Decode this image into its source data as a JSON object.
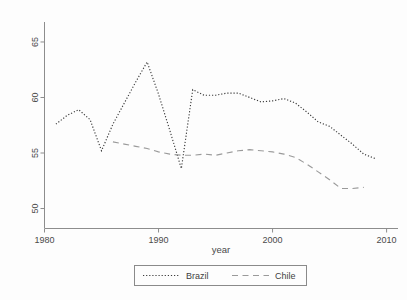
{
  "chart_data": {
    "type": "line",
    "title": "",
    "xlabel": "year",
    "ylabel": "",
    "xlim": [
      1980,
      2011
    ],
    "ylim": [
      48.2,
      66.8
    ],
    "grid": false,
    "legend_position": "bottom",
    "x_ticks": [
      "1980",
      "1990",
      "2000",
      "2010"
    ],
    "x_tick_values": [
      1980,
      1990,
      2000,
      2010
    ],
    "y_ticks": [
      "50",
      "55",
      "60",
      "65"
    ],
    "y_tick_values": [
      50,
      55,
      60,
      65
    ],
    "series": [
      {
        "name": "Brazil",
        "style": "dotted",
        "color": "#3b3b3b",
        "x": [
          1981,
          1982,
          1983,
          1984,
          1985,
          1986,
          1987,
          1988,
          1989,
          1990,
          1991,
          1992,
          1993,
          1994,
          1995,
          1996,
          1997,
          1998,
          1999,
          2000,
          2001,
          2002,
          2003,
          2004,
          2005,
          2006,
          2007,
          2008,
          2009
        ],
        "values": [
          57.6,
          58.4,
          58.9,
          58.0,
          55.2,
          57.6,
          59.5,
          61.4,
          63.2,
          60.3,
          57.0,
          53.6,
          60.7,
          60.2,
          60.2,
          60.4,
          60.4,
          60.0,
          59.6,
          59.7,
          59.9,
          59.5,
          58.7,
          57.8,
          57.4,
          56.6,
          55.8,
          54.9,
          54.5
        ]
      },
      {
        "name": "Chile",
        "style": "dashed",
        "color": "#9a9a9a",
        "x": [
          1986,
          1987,
          1988,
          1989,
          1990,
          1991,
          1992,
          1993,
          1994,
          1995,
          1996,
          1997,
          1998,
          1999,
          2000,
          2001,
          2002,
          2003,
          2004,
          2005,
          2006,
          2007,
          2008
        ],
        "values": [
          56.0,
          55.8,
          55.6,
          55.4,
          55.1,
          54.9,
          54.8,
          54.8,
          54.9,
          54.8,
          55.0,
          55.2,
          55.3,
          55.2,
          55.1,
          54.9,
          54.6,
          54.0,
          53.3,
          52.6,
          51.8,
          51.8,
          51.9
        ]
      }
    ]
  },
  "legend": {
    "entries": [
      {
        "label": "Brazil"
      },
      {
        "label": "Chile"
      }
    ]
  },
  "axes": {
    "x_title": "year"
  }
}
